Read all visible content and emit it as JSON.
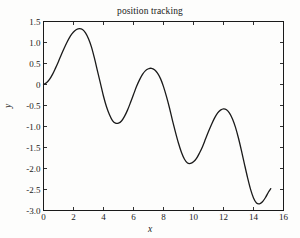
{
  "figure": {
    "background_color": "#fdfdfc",
    "axes_color": "#1a1a1a",
    "line_color": "#1a1a1a"
  },
  "chart_data": {
    "type": "line",
    "title": "position tracking",
    "xlabel": "x",
    "ylabel": "y",
    "xlim": [
      0,
      16
    ],
    "ylim": [
      -3.0,
      1.5
    ],
    "grid": false,
    "legend": null,
    "xticks": [
      0,
      2,
      4,
      6,
      8,
      10,
      12,
      14,
      16
    ],
    "xtick_labels": [
      "0",
      "2",
      "4",
      "6",
      "8",
      "10",
      "12",
      "14",
      "16"
    ],
    "yticks": [
      1.5,
      1.0,
      0.5,
      0,
      -0.5,
      -1.0,
      -1.5,
      -2.0,
      -2.5,
      -3.0
    ],
    "ytick_labels": [
      "1.5",
      "1.0",
      "0.5",
      "0",
      "-0.5",
      "-1.0",
      "-1.5",
      "-2.0",
      "-2.5",
      "-3.0"
    ],
    "series": [
      {
        "name": "position",
        "color": "#1a1a1a",
        "line_width": 1.3,
        "x": [
          0.0,
          0.2,
          0.4,
          0.6,
          0.8,
          1.0,
          1.2,
          1.4,
          1.6,
          1.8,
          2.0,
          2.2,
          2.4,
          2.6,
          2.8,
          3.0,
          3.2,
          3.4,
          3.6,
          3.8,
          4.0,
          4.2,
          4.4,
          4.6,
          4.8,
          5.0,
          5.2,
          5.4,
          5.6,
          5.8,
          6.0,
          6.2,
          6.4,
          6.6,
          6.8,
          7.0,
          7.2,
          7.4,
          7.6,
          7.8,
          8.0,
          8.2,
          8.4,
          8.6,
          8.8,
          9.0,
          9.2,
          9.4,
          9.6,
          9.8,
          10.0,
          10.2,
          10.4,
          10.6,
          10.8,
          11.0,
          11.2,
          11.4,
          11.6,
          11.8,
          12.0,
          12.2,
          12.4,
          12.6,
          12.8,
          13.0,
          13.2,
          13.4,
          13.6,
          13.8,
          14.0,
          14.2,
          14.4,
          14.6,
          14.8,
          15.0,
          15.15
        ],
        "y": [
          0.0,
          0.04,
          0.12,
          0.24,
          0.39,
          0.55,
          0.72,
          0.88,
          1.03,
          1.16,
          1.25,
          1.31,
          1.33,
          1.31,
          1.23,
          1.09,
          0.89,
          0.62,
          0.32,
          0.02,
          -0.28,
          -0.53,
          -0.72,
          -0.86,
          -0.92,
          -0.92,
          -0.87,
          -0.76,
          -0.61,
          -0.43,
          -0.24,
          -0.05,
          0.11,
          0.24,
          0.33,
          0.375,
          0.385,
          0.35,
          0.27,
          0.14,
          -0.05,
          -0.29,
          -0.56,
          -0.86,
          -1.14,
          -1.4,
          -1.62,
          -1.78,
          -1.87,
          -1.88,
          -1.84,
          -1.76,
          -1.63,
          -1.48,
          -1.3,
          -1.12,
          -0.95,
          -0.8,
          -0.68,
          -0.61,
          -0.58,
          -0.6,
          -0.68,
          -0.82,
          -1.02,
          -1.28,
          -1.58,
          -1.9,
          -2.21,
          -2.49,
          -2.7,
          -2.82,
          -2.84,
          -2.79,
          -2.69,
          -2.56,
          -2.48
        ]
      }
    ]
  }
}
